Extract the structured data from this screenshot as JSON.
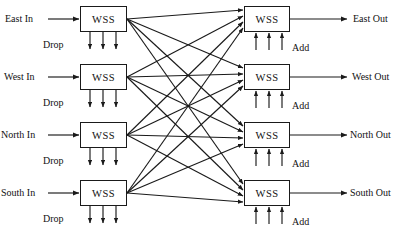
{
  "diagram": {
    "node_label": "WSS",
    "drop_label": "Drop",
    "add_label": "Add",
    "stroke_color": "#1a1a1a",
    "background_color": "#ffffff",
    "ingress": [
      {
        "label": "East In",
        "row": 0
      },
      {
        "label": "West In",
        "row": 1
      },
      {
        "label": "North In",
        "row": 2
      },
      {
        "label": "South In",
        "row": 3
      }
    ],
    "egress": [
      {
        "label": "East Out",
        "row": 0
      },
      {
        "label": "West Out",
        "row": 1
      },
      {
        "label": "North Out",
        "row": 2
      },
      {
        "label": "South Out",
        "row": 3
      }
    ],
    "drop_ports_per_node": 3,
    "add_ports_per_node": 3,
    "mesh": "full 4x4 interconnect: every ingress WSS feeds every egress WSS"
  }
}
